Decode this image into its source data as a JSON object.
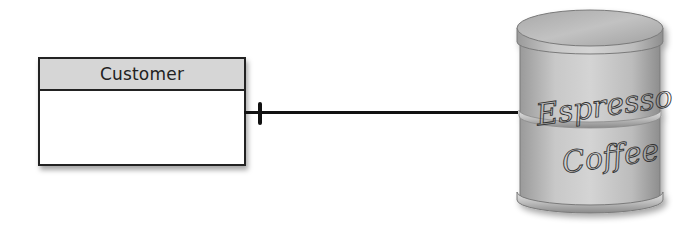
{
  "diagram": {
    "entity": {
      "title": "Customer"
    },
    "relationship": {
      "cardinality_marker": "one"
    },
    "datastore": {
      "label_line1": "Espresso",
      "label_line2": "Coffee",
      "shape": "coffee-can-cylinder"
    },
    "colors": {
      "entity_header": "#d6d6d6",
      "entity_border": "#222222",
      "connector": "#111111",
      "can_body": "#bdbdbd",
      "can_lid": "#b5b5b5"
    }
  }
}
